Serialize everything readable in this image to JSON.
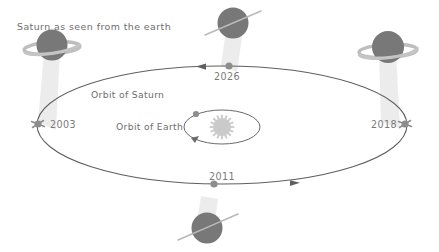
{
  "figure": {
    "caption": "Saturn as seen from the earth",
    "orbit_saturn_label": "Orbit of Saturn",
    "orbit_earth_label": "Orbit of Earth",
    "background_color": "#ffffff",
    "line_color": "#5f5f5f",
    "text_color": "#6d6d6d",
    "planet_color": "#787878",
    "ring_color": "#bdbdbd",
    "beam_color": "#e9e9e9",
    "sun_color": "#c9c9c9"
  },
  "nodes": [
    {
      "id": "left",
      "year": "2003",
      "ring_view": "open-rings",
      "position": "left",
      "icon": "saturn-open-rings-icon"
    },
    {
      "id": "top",
      "year": "2026",
      "ring_view": "edge-on-rings",
      "position": "top",
      "icon": "saturn-edge-on-rings-icon"
    },
    {
      "id": "right",
      "year": "2018",
      "ring_view": "open-rings",
      "position": "right",
      "icon": "saturn-open-rings-icon"
    },
    {
      "id": "bottom",
      "year": "2011",
      "ring_view": "edge-on-rings",
      "position": "bottom",
      "icon": "saturn-edge-on-rings-icon"
    }
  ],
  "center": {
    "sun_icon": "sun-icon",
    "earth_icon": "earth-dot-icon"
  }
}
